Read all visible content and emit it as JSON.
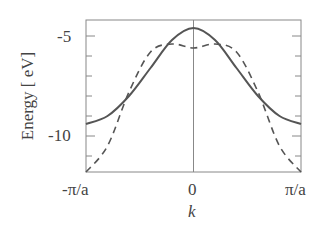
{
  "chart_data": {
    "type": "line",
    "title": "",
    "xlabel": "k",
    "ylabel": "Energy [ eV]",
    "xticks": [
      "-π/a",
      "0",
      "π/a"
    ],
    "yticks": [
      "-5",
      "-10"
    ],
    "ylim": [
      -11.8,
      -4.2
    ],
    "xlim": [
      -1,
      1
    ],
    "grid": false,
    "vertical_line_at": 0,
    "x": [
      -1,
      -0.8,
      -0.6,
      -0.4,
      -0.2,
      0,
      0.2,
      0.4,
      0.6,
      0.8,
      1
    ],
    "series": [
      {
        "name": "solid",
        "style": "solid",
        "values": [
          -9.4,
          -9.0,
          -8.0,
          -6.6,
          -5.2,
          -4.6,
          -5.2,
          -6.6,
          -8.0,
          -9.0,
          -9.4
        ]
      },
      {
        "name": "dashed",
        "style": "dashed",
        "values": [
          -11.8,
          -10.5,
          -7.8,
          -5.8,
          -5.4,
          -5.6,
          -5.4,
          -5.8,
          -7.8,
          -10.5,
          -11.8
        ]
      }
    ]
  },
  "labels": {
    "ylabel": "Energy [ eV]",
    "ytick_top": "-5",
    "ytick_bottom": "-10",
    "xtick_left": "-π/a",
    "xtick_mid": "0",
    "xtick_right": "π/a",
    "xlabel": "k"
  }
}
